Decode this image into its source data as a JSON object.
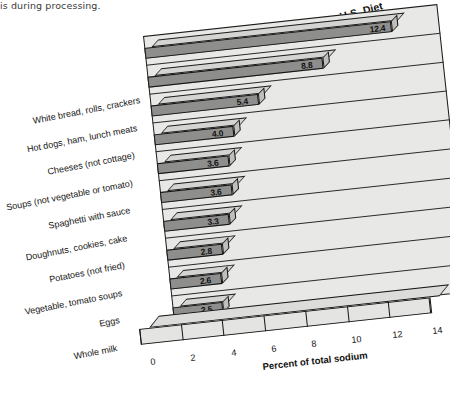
{
  "page_fragment": "is during processing.",
  "chart_data": {
    "type": "bar",
    "orientation": "horizontal",
    "style": "3d-perspective",
    "title": "Top Ten Contributors of Sodium in the U.S. Diet",
    "xlabel": "Percent of total sodium",
    "ylabel": "",
    "xlim": [
      0,
      14
    ],
    "xticks": [
      "0",
      "2",
      "4",
      "6",
      "8",
      "10",
      "12",
      "14"
    ],
    "grid": true,
    "legend": "none",
    "categories": [
      "White bread, rolls, crackers",
      "Hot dogs, ham, lunch meats",
      "Cheeses (not cottage)",
      "Soups (not vegetable or tomato)",
      "Spaghetti with sauce",
      "Doughnuts, cookies, cake",
      "Potatoes (not fried)",
      "Vegetable, tomato soups",
      "Eggs",
      "Whole milk"
    ],
    "values": [
      12.4,
      8.8,
      5.4,
      4.0,
      3.6,
      3.6,
      3.3,
      2.8,
      2.6,
      2.5
    ],
    "value_labels": [
      "12.4",
      "8.8",
      "5.4",
      "4.0",
      "3.6",
      "3.6",
      "3.3",
      "2.8",
      "2.6",
      "2.5"
    ],
    "colors": {
      "bar_face": "#8e8e8c",
      "bar_top": "#d4d4d2",
      "bar_cap": "#bfbfbd",
      "wall": "#e8e8e6",
      "outline": "#141414",
      "text": "#111111"
    }
  }
}
